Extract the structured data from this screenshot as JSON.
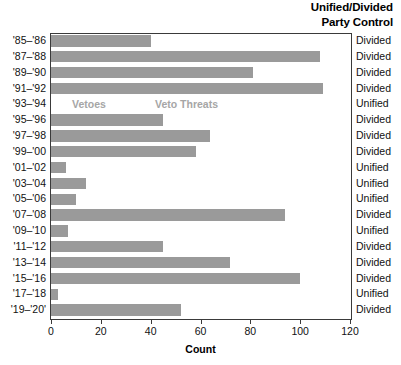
{
  "header": {
    "line1": "Unified/Divided",
    "line2": "Party Control"
  },
  "legend": {
    "vetoes": "Vetoes",
    "veto_threats": "Veto Threats"
  },
  "axis": {
    "x_title": "Count",
    "ticks": [
      "0",
      "20",
      "40",
      "60",
      "80",
      "100",
      "120"
    ]
  },
  "colors": {
    "bar": "#9a9a9a",
    "legend_text": "#a6a6a6",
    "frame": "#3a3a3a",
    "text": "#111111"
  },
  "chart_data": {
    "type": "bar",
    "orientation": "horizontal",
    "title": "",
    "xlabel": "Count",
    "ylabel": "",
    "xlim": [
      0,
      120
    ],
    "xticks": [
      0,
      20,
      40,
      60,
      80,
      100,
      120
    ],
    "grid": false,
    "legend_position": "inside-top-left",
    "legend_entries": [
      "Vetoes",
      "Veto Threats"
    ],
    "annotations": [
      "Unified/Divided Party Control"
    ],
    "categories": [
      "'85–'86",
      "'87–'88",
      "'89–'90",
      "'91–'92",
      "'93–'94",
      "'95–'96",
      "'97–'98",
      "'99–'00",
      "'01–'02",
      "'03–'04",
      "'05–'06",
      "'07–'08",
      "'09–'10",
      "'11–'12",
      "'13–'14",
      "'15–'16",
      "'17–'18",
      "'19–'20'"
    ],
    "values": [
      40,
      108,
      81,
      109,
      0,
      45,
      64,
      58,
      6,
      14,
      10,
      94,
      7,
      45,
      72,
      100,
      3,
      52
    ],
    "party_control": [
      "Divided",
      "Divided",
      "Divided",
      "Divided",
      "Unified",
      "Divided",
      "Divided",
      "Divided",
      "Unified",
      "Unified",
      "Unified",
      "Divided",
      "Unified",
      "Divided",
      "Divided",
      "Divided",
      "Unified",
      "Divided"
    ]
  }
}
